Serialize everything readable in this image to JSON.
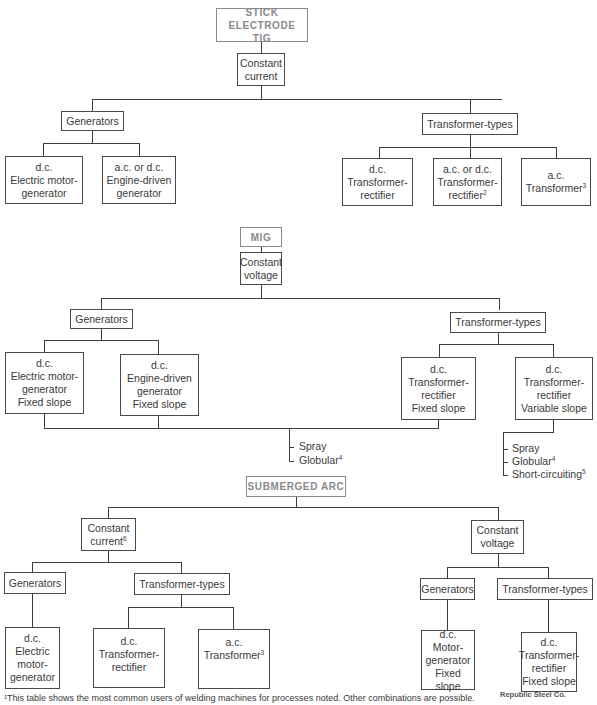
{
  "diagram": {
    "type": "welding-power-source-tree",
    "sections": [
      {
        "process": "STICK ELECTRODE\nTIG",
        "output": "Constant current",
        "branches": [
          {
            "label": "Generators",
            "children": [
              {
                "lines": [
                  "d.c.",
                  "Electric motor-",
                  "generator"
                ]
              },
              {
                "lines": [
                  "a.c. or d.c.",
                  "Engine-driven",
                  "generator"
                ]
              }
            ]
          },
          {
            "label": "Transformer-types",
            "children": [
              {
                "lines": [
                  "d.c.",
                  "Transformer-",
                  "rectifier"
                ]
              },
              {
                "lines": [
                  "a.c. or d.c.",
                  "Transformer-",
                  "rectifier"
                ],
                "footnote": "2"
              },
              {
                "lines": [
                  "a.c.",
                  "Transformer"
                ],
                "footnote": "3"
              }
            ]
          }
        ]
      },
      {
        "process": "MIG",
        "output": "Constant voltage",
        "branches": [
          {
            "label": "Generators",
            "children": [
              {
                "lines": [
                  "d.c.",
                  "Electric motor-",
                  "generator",
                  "Fixed slope"
                ]
              },
              {
                "lines": [
                  "d.c.",
                  "Engine-driven",
                  "generator",
                  "Fixed slope"
                ]
              }
            ]
          },
          {
            "label": "Transformer-types",
            "children": [
              {
                "lines": [
                  "d.c.",
                  "Transformer-",
                  "rectifier",
                  "Fixed slope"
                ]
              },
              {
                "lines": [
                  "d.c.",
                  "Transformer-",
                  "rectifier",
                  "Variable slope"
                ]
              }
            ]
          }
        ],
        "transfer_modes_fixed": [
          {
            "text": "Spray"
          },
          {
            "text": "Globular",
            "footnote": "4"
          }
        ],
        "transfer_modes_variable": [
          {
            "text": "Spray"
          },
          {
            "text": "Globular",
            "footnote": "4"
          },
          {
            "text": "Short-circuiting",
            "footnote": "5"
          }
        ]
      },
      {
        "process": "SUBMERGED ARC",
        "outputs": [
          {
            "label": "Constant",
            "label2": "current",
            "footnote": "6",
            "branches": [
              {
                "label": "Generators",
                "children": [
                  {
                    "lines": [
                      "d.c.",
                      "Electric",
                      "motor-",
                      "generator"
                    ]
                  }
                ]
              },
              {
                "label": "Transformer-types",
                "children": [
                  {
                    "lines": [
                      "d.c.",
                      "Transformer-",
                      "rectifier"
                    ]
                  },
                  {
                    "lines": [
                      "a.c.",
                      "Transformer"
                    ],
                    "footnote": "3"
                  }
                ]
              }
            ]
          },
          {
            "label": "Constant",
            "label2": "voltage",
            "branches": [
              {
                "label": "Generators",
                "children": [
                  {
                    "lines": [
                      "d.c.",
                      "Motor-",
                      "generator",
                      "Fixed slope"
                    ]
                  }
                ]
              },
              {
                "label": "Transformer-types",
                "children": [
                  {
                    "lines": [
                      "d.c.",
                      "Transformer-",
                      "rectifier",
                      "Fixed slope"
                    ]
                  }
                ]
              }
            ]
          }
        ]
      }
    ]
  },
  "t": {
    "s1_proc1": "STICK ELECTRODE",
    "s1_proc2": "TIG",
    "s1_out1": "Constant",
    "s1_out2": "current",
    "gen": "Generators",
    "trans": "Transformer-types",
    "dc": "d.c.",
    "ac": "a.c.",
    "acdc": "a.c. or d.c.",
    "elec_motor": "Electric motor-",
    "generator": "generator",
    "engine": "Engine-driven",
    "transformer_dash": "Transformer-",
    "rectifier": "rectifier",
    "transformer": "Transformer",
    "fixed": "Fixed slope",
    "variable": "Variable slope",
    "mig": "MIG",
    "const": "Constant",
    "voltage": "voltage",
    "current": "current",
    "spray": "Spray",
    "globular": "Globular",
    "short": "Short-circuiting",
    "sub": "SUBMERGED ARC",
    "electric": "Electric",
    "motor_dash": "motor-",
    "Motor_dash": "Motor-",
    "fn2": "2",
    "fn3": "3",
    "fn4": "4",
    "fn5": "5",
    "fn6": "6"
  },
  "footnote_text": "¹This table shows the most common users of welding machines for processes noted. Other combinations are possible.",
  "credit": "Republic Steel Co."
}
